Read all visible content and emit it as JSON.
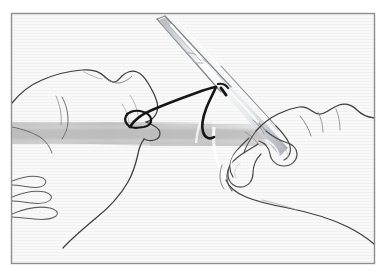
{
  "figure": {
    "title": "Surgical suturing technique illustration",
    "style": "pen-and-ink line art, no shading fills, horizontal scanline paper texture",
    "frame": {
      "border_color": "#8d8d8d",
      "border_width_px": 1,
      "x": 11,
      "y": 13,
      "width": 364,
      "height": 251
    },
    "colors": {
      "page_background": "#ffffff",
      "panel_background": "#f7f7f7",
      "line_stroke": "#3a3a3a",
      "line_stroke_light": "#8e8e93",
      "suture_stroke": "#1a1a1a",
      "instrument_stroke": "#9aa0a6",
      "wound_band": "#c2c2c2",
      "highlight_white": "#ffffff"
    },
    "elements": [
      {
        "name": "left-hand",
        "label": "Left hand (non-dominant) pinching suture strand",
        "side": "left"
      },
      {
        "name": "right-hand",
        "label": "Right hand (dominant) holding needle holder in ring handles",
        "side": "right"
      },
      {
        "name": "needle-holder",
        "label": "Needle holder / hemostat with ratcheted ring handles",
        "orientation": "diagonal, tips toward upper-left"
      },
      {
        "name": "suture-thread",
        "label": "Suture strand looped around instrument shaft",
        "color": "#1a1a1a"
      },
      {
        "name": "wound-band",
        "label": "Shaded tissue / wound line across the field",
        "color": "#c2c2c2"
      }
    ]
  }
}
